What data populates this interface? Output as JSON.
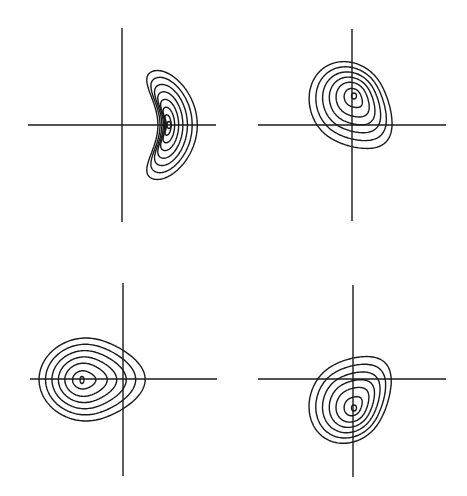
{
  "figure": {
    "width": 467,
    "height": 496,
    "background": "#ffffff",
    "line_color": "#1a1a1a"
  },
  "panels": [
    {
      "id": "top-left",
      "axes": {
        "x_axis": {
          "y": 125,
          "x1": 28,
          "x2": 216
        },
        "y_axis": {
          "x": 122,
          "y1": 28,
          "y2": 222
        }
      },
      "shape": "crescent",
      "peak": {
        "x": 169,
        "y": 125
      },
      "outer_extent": {
        "left": 135,
        "right": 190,
        "top": 68,
        "bottom": 177
      },
      "rings": [
        1.0,
        0.86,
        0.72,
        0.58,
        0.44,
        0.3,
        0.17
      ],
      "center_mark": {
        "rx": 2,
        "ry": 3.5
      }
    },
    {
      "id": "top-right",
      "axes": {
        "x_axis": {
          "y": 125,
          "x1": 258,
          "x2": 446
        },
        "y_axis": {
          "x": 352,
          "y1": 29,
          "y2": 221
        }
      },
      "shape": "teardrop-down-right",
      "peak": {
        "x": 354,
        "y": 96
      },
      "outer_extent": {
        "left": 307,
        "right": 389,
        "top": 53,
        "bottom": 153
      },
      "anchor": {
        "x": 352,
        "y": 125
      },
      "rings": [
        1.0,
        0.85,
        0.7,
        0.55,
        0.4,
        0.22
      ],
      "center_mark": {
        "rx": 2.5,
        "ry": 3
      }
    },
    {
      "id": "bottom-left",
      "axes": {
        "x_axis": {
          "y": 379,
          "x1": 30,
          "x2": 217
        },
        "y_axis": {
          "x": 123,
          "y1": 283,
          "y2": 476
        }
      },
      "shape": "teardrop-right",
      "peak": {
        "x": 82,
        "y": 380
      },
      "outer_extent": {
        "left": 35,
        "right": 137,
        "top": 338,
        "bottom": 421
      },
      "anchor": {
        "x": 123,
        "y": 379
      },
      "rings": [
        1.0,
        0.85,
        0.7,
        0.55,
        0.4,
        0.22
      ],
      "center_mark": {
        "rx": 2,
        "ry": 3.5
      }
    },
    {
      "id": "bottom-right",
      "axes": {
        "x_axis": {
          "y": 379,
          "x1": 258,
          "x2": 446
        },
        "y_axis": {
          "x": 353,
          "y1": 285,
          "y2": 477
        }
      },
      "shape": "teardrop-up-right",
      "peak": {
        "x": 354,
        "y": 408
      },
      "outer_extent": {
        "left": 307,
        "right": 388,
        "top": 352,
        "bottom": 452
      },
      "anchor": {
        "x": 352,
        "y": 379
      },
      "rings": [
        1.0,
        0.85,
        0.7,
        0.55,
        0.4,
        0.22
      ],
      "center_mark": {
        "rx": 2.5,
        "ry": 3
      }
    }
  ]
}
